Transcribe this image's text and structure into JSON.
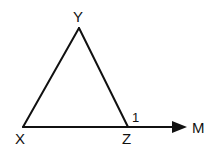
{
  "diagram": {
    "type": "geometry-triangle-exterior-angle",
    "colors": {
      "stroke": "#111111",
      "background": "#ffffff"
    },
    "vertices": [
      {
        "id": "Y",
        "label": "Y",
        "x": 79,
        "y": 28
      },
      {
        "id": "X",
        "label": "X",
        "x": 23,
        "y": 127
      },
      {
        "id": "Z",
        "label": "Z",
        "x": 128,
        "y": 127
      }
    ],
    "segments": [
      {
        "from": "X",
        "to": "Y"
      },
      {
        "from": "Y",
        "to": "Z"
      },
      {
        "from": "X",
        "to": "Z"
      }
    ],
    "ray": {
      "from": "Z",
      "to_label": "M",
      "label": "M"
    },
    "angle_marker": {
      "label": "1",
      "at": "Z",
      "description": "exterior angle YZM"
    },
    "labels": {
      "Y": "Y",
      "X": "X",
      "Z": "Z",
      "M": "M",
      "angle": "1"
    }
  }
}
